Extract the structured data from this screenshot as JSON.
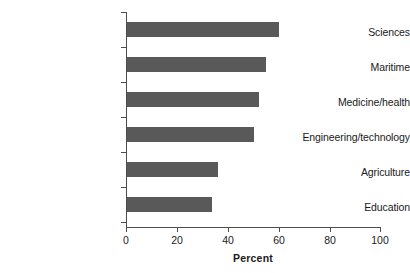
{
  "chart_data": {
    "type": "bar",
    "orientation": "horizontal",
    "title": "",
    "subtitle": "",
    "xlabel": "Percent",
    "ylabel": "",
    "categories": [
      "Sciences",
      "Maritime",
      "Medicine/health",
      "Engineering/technology",
      "Agriculture",
      "Education"
    ],
    "values": [
      60,
      55,
      52,
      50,
      36,
      33.5
    ],
    "series": [
      {
        "name": "Percent",
        "values": [
          60,
          55,
          52,
          50,
          36,
          33.5
        ]
      }
    ],
    "xlim": [
      0,
      100
    ],
    "xticks": [
      0,
      20,
      40,
      60,
      80,
      100
    ],
    "xtick_labels": [
      "0",
      "20",
      "40",
      "60",
      "80",
      "100"
    ],
    "grid": false,
    "legend": false,
    "legend_position": "none",
    "bar_color": "#595959",
    "axis_color": "#4d4d4d",
    "background_color": "#ffffff",
    "annotations": []
  },
  "axes": {
    "x_axis_title": "Percent",
    "x_tick_labels": [
      "0",
      "20",
      "40",
      "60",
      "80",
      "100"
    ],
    "y_tick_labels": [
      "Sciences",
      "Maritime",
      "Medicine/health",
      "Engineering/technology",
      "Agriculture",
      "Education"
    ]
  }
}
